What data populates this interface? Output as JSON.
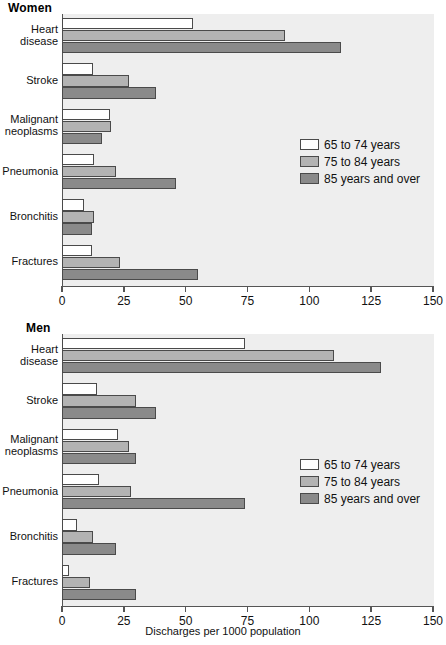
{
  "chart_data": {
    "type": "bar",
    "orientation": "horizontal",
    "title": "",
    "xlabel": "Discharges per 1000 population",
    "ylabel": "",
    "xlim": [
      0,
      150
    ],
    "xticks": [
      0,
      25,
      50,
      75,
      100,
      125,
      150
    ],
    "grid": false,
    "legend_position": "center-right inside plot",
    "categories": [
      "Heart disease",
      "Stroke",
      "Malignant neoplasms",
      "Pneumonia",
      "Bronchitis",
      "Fractures"
    ],
    "series_names": [
      "65 to 74 years",
      "75 to 84 years",
      "85 years and over"
    ],
    "panels": [
      {
        "name": "Women",
        "series": [
          {
            "name": "65 to 74 years",
            "values": [
              53,
              12.5,
              19.5,
              13,
              9,
              12
            ]
          },
          {
            "name": "75 to 84 years",
            "values": [
              90,
              27,
              20,
              22,
              13,
              23.5
            ]
          },
          {
            "name": "85 years and over",
            "values": [
              113,
              38,
              16,
              46,
              12,
              55
            ]
          }
        ]
      },
      {
        "name": "Men",
        "series": [
          {
            "name": "65 to 74 years",
            "values": [
              74,
              14,
              22.5,
              15,
              6,
              3
            ]
          },
          {
            "name": "75 to 84 years",
            "values": [
              110,
              30,
              27,
              28,
              12.5,
              11.5
            ]
          },
          {
            "name": "85 years and over",
            "values": [
              129,
              38,
              30,
              74,
              22,
              30
            ]
          }
        ]
      }
    ],
    "colors": {
      "series_65_74": "#ffffff",
      "series_75_84": "#b3b3b3",
      "series_85_over": "#8a8a8a",
      "plot_background": "#eeeeee",
      "bar_outline": "#4a4a4a",
      "axis": "#555555"
    }
  },
  "panel_women": {
    "title": "Women",
    "categories": [
      {
        "line1": "Heart",
        "line2": "disease"
      },
      {
        "line1": "Stroke",
        "line2": ""
      },
      {
        "line1": "Malignant",
        "line2": "neoplasms"
      },
      {
        "line1": "Pneumonia",
        "line2": ""
      },
      {
        "line1": "Bronchitis",
        "line2": ""
      },
      {
        "line1": "Fractures",
        "line2": ""
      }
    ],
    "ticks": [
      "0",
      "25",
      "50",
      "75",
      "100",
      "125",
      "150"
    ],
    "legend": [
      {
        "label": "65 to 74 years"
      },
      {
        "label": "75 to 84 years"
      },
      {
        "label": "85 years and over"
      }
    ]
  },
  "panel_men": {
    "title": "Men",
    "categories": [
      {
        "line1": "Heart",
        "line2": "disease"
      },
      {
        "line1": "Stroke",
        "line2": ""
      },
      {
        "line1": "Malignant",
        "line2": "neoplasms"
      },
      {
        "line1": "Pneumonia",
        "line2": ""
      },
      {
        "line1": "Bronchitis",
        "line2": ""
      },
      {
        "line1": "Fractures",
        "line2": ""
      }
    ],
    "ticks": [
      "0",
      "25",
      "50",
      "75",
      "100",
      "125",
      "150"
    ],
    "legend": [
      {
        "label": "65 to 74 years"
      },
      {
        "label": "75 to 84 years"
      },
      {
        "label": "85 years and over"
      }
    ],
    "axis_title": "Discharges per 1000 population"
  }
}
